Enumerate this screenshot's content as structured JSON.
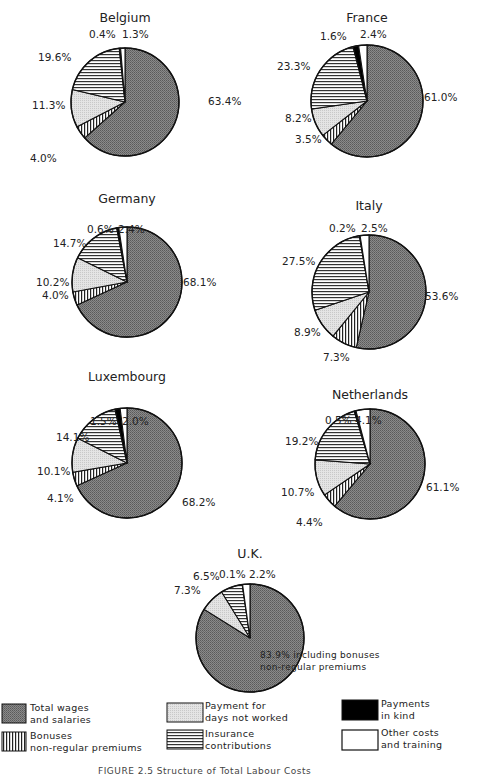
{
  "chart_data": [
    {
      "type": "pie",
      "title": "Belgium",
      "categories": [
        "Total wages and salaries",
        "Bonuses non-regular premiums",
        "Payment for days not worked",
        "Insurance contributions",
        "Payments in kind",
        "Other costs and training"
      ],
      "values": [
        63.4,
        4.0,
        11.3,
        19.6,
        0.4,
        1.3
      ],
      "labels": [
        "63.4%",
        "4.0%",
        "11.3%",
        "19.6%",
        "0.4%",
        "1.3%"
      ]
    },
    {
      "type": "pie",
      "title": "France",
      "categories": [
        "Total wages and salaries",
        "Bonuses non-regular premiums",
        "Payment for days not worked",
        "Insurance contributions",
        "Payments in kind",
        "Other costs and training"
      ],
      "values": [
        61.0,
        3.5,
        8.2,
        23.3,
        1.6,
        2.4
      ],
      "labels": [
        "61.0%",
        "3.5%",
        "8.2%",
        "23.3%",
        "1.6%",
        "2.4%"
      ]
    },
    {
      "type": "pie",
      "title": "Germany",
      "categories": [
        "Total wages and salaries",
        "Bonuses non-regular premiums",
        "Payment for days not worked",
        "Insurance contributions",
        "Payments in kind",
        "Other costs and training"
      ],
      "values": [
        68.1,
        4.0,
        10.2,
        14.7,
        0.6,
        2.4
      ],
      "labels": [
        "68.1%",
        "4.0%",
        "10.2%",
        "14.7%",
        "0.6%",
        "2.4%"
      ]
    },
    {
      "type": "pie",
      "title": "Italy",
      "categories": [
        "Total wages and salaries",
        "Bonuses non-regular premiums",
        "Payment for days not worked",
        "Insurance contributions",
        "Payments in kind",
        "Other costs and training"
      ],
      "values": [
        53.6,
        7.3,
        8.9,
        27.5,
        0.2,
        2.5
      ],
      "labels": [
        "53.6%",
        "7.3%",
        "8.9%",
        "27.5%",
        "0.2%",
        "2.5%"
      ]
    },
    {
      "type": "pie",
      "title": "Luxembourg",
      "categories": [
        "Total wages and salaries",
        "Bonuses non-regular premiums",
        "Payment for days not worked",
        "Insurance contributions",
        "Payments in kind",
        "Other costs and training"
      ],
      "values": [
        68.2,
        4.1,
        10.1,
        14.1,
        1.5,
        2.0
      ],
      "labels": [
        "68.2%",
        "4.1%",
        "10.1%",
        "14.1%",
        "1.5%",
        "2.0%"
      ]
    },
    {
      "type": "pie",
      "title": "Netherlands",
      "categories": [
        "Total wages and salaries",
        "Bonuses non-regular premiums",
        "Payment for days not worked",
        "Insurance contributions",
        "Payments in kind",
        "Other costs and training"
      ],
      "values": [
        61.1,
        4.4,
        10.7,
        19.2,
        0.5,
        4.1
      ],
      "labels": [
        "61.1%",
        "4.4%",
        "10.7%",
        "19.2%",
        "0.5%",
        "4.1%"
      ]
    },
    {
      "type": "pie",
      "title": "U.K.",
      "categories": [
        "Total wages and salaries",
        "Payment for days not worked",
        "Insurance contributions",
        "Payments in kind",
        "Other costs and training"
      ],
      "values": [
        83.9,
        7.3,
        6.5,
        0.1,
        2.2
      ],
      "labels": [
        "83.9%",
        "7.3%",
        "6.5%",
        "0.1%",
        "2.2%"
      ],
      "annotation": "83.9% including bonuses non-regular premiums"
    }
  ],
  "pies": {
    "belgium": {
      "title": "Belgium",
      "l_wages": "63.4%",
      "l_bonus": "4.0%",
      "l_days": "11.3%",
      "l_ins": "19.6%",
      "l_kind": "0.4%",
      "l_other": "1.3%"
    },
    "france": {
      "title": "France",
      "l_wages": "61.0%",
      "l_bonus": "3.5%",
      "l_days": "8.2%",
      "l_ins": "23.3%",
      "l_kind": "1.6%",
      "l_other": "2.4%"
    },
    "germany": {
      "title": "Germany",
      "l_wages": "68.1%",
      "l_bonus": "4.0%",
      "l_days": "10.2%",
      "l_ins": "14.7%",
      "l_kind": "0.6%",
      "l_other": "2.4%"
    },
    "italy": {
      "title": "Italy",
      "l_wages": "53.6%",
      "l_bonus": "7.3%",
      "l_days": "8.9%",
      "l_ins": "27.5%",
      "l_kind": "0.2%",
      "l_other": "2.5%"
    },
    "luxembourg": {
      "title": "Luxembourg",
      "l_wages": "68.2%",
      "l_bonus": "4.1%",
      "l_days": "10.1%",
      "l_ins": "14.1%",
      "l_kind": "1.5%",
      "l_other": "2.0%"
    },
    "netherlands": {
      "title": "Netherlands",
      "l_wages": "61.1%",
      "l_bonus": "4.4%",
      "l_days": "10.7%",
      "l_ins": "19.2%",
      "l_kind": "0.5%",
      "l_other": "4.1%"
    },
    "uk": {
      "title": "U.K.",
      "l_wages": "83.9% including bonuses",
      "l_wages2": "non-regular premiums",
      "l_days": "7.3%",
      "l_ins": "6.5%",
      "l_kind": "0.1%",
      "l_other": "2.2%"
    }
  },
  "legend": {
    "wages": [
      "Total wages",
      "and salaries"
    ],
    "bonus": [
      "Bonuses",
      "non-regular premiums"
    ],
    "days": [
      "Payment for",
      "days not worked"
    ],
    "ins": [
      "Insurance",
      "contributions"
    ],
    "kind": [
      "Payments",
      "in kind"
    ],
    "other": [
      "Other costs",
      "and training"
    ]
  },
  "caption": "FIGURE 2.5  Structure of Total Labour Costs"
}
